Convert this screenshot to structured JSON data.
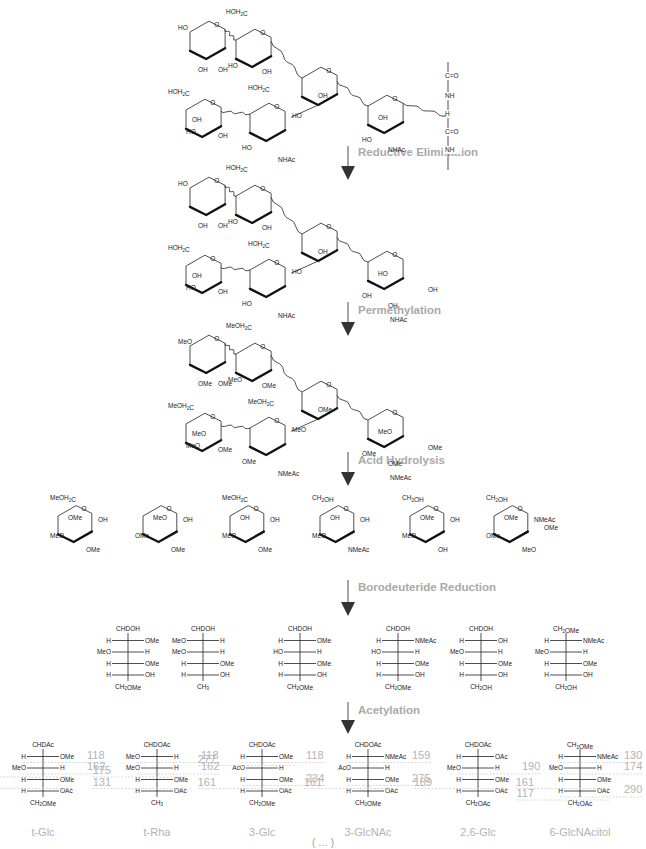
{
  "steps": [
    {
      "label": "Reductive Elimination"
    },
    {
      "label": "Permethylation"
    },
    {
      "label": "Acid Hydrolysis"
    },
    {
      "label": "Borodeuteride Reduction"
    },
    {
      "label": "Acetylation"
    }
  ],
  "glycopeptide": {
    "backbone": [
      "C=O",
      "NH",
      "H",
      "C=O",
      "NH"
    ],
    "labels": [
      "HO",
      "HOH2C",
      "OH",
      "OH",
      "HO",
      "OH",
      "HO",
      "OH",
      "HOH2C",
      "HOH2C",
      "OH",
      "HO",
      "HO",
      "OH",
      "NHAc",
      "HO",
      "OH",
      "NHAc"
    ]
  },
  "reduced": {
    "labels": [
      "HO",
      "HOH2C",
      "OH",
      "OH",
      "HO",
      "OH",
      "HO",
      "OH",
      "HOH2C",
      "HOH2C",
      "OH",
      "HO",
      "HO",
      "OH",
      "NHAc",
      "OH",
      "HO",
      "OH",
      "OH",
      "NHAc"
    ]
  },
  "permethylated": {
    "labels": [
      "MeO",
      "MeOH2C",
      "OMe",
      "OMe",
      "MeO",
      "OMe",
      "MeO",
      "OMe",
      "MeOH2C",
      "MeOH2C",
      "OMe",
      "MeO",
      "OMe",
      "MeO",
      "NMeAc",
      "OMe",
      "MeO",
      "OMe",
      "OMe",
      "NMeAc"
    ]
  },
  "hydrolysis_products": [
    {
      "top": "MeOH2C",
      "labels": [
        "OMe",
        "MeO",
        "OMe",
        "OH"
      ]
    },
    {
      "top": "",
      "labels": [
        "MeO",
        "OMe",
        "OMe",
        "OH"
      ]
    },
    {
      "top": "MeOH2C",
      "labels": [
        "OH",
        "MeO",
        "OMe",
        "OH"
      ]
    },
    {
      "top": "CH2OH",
      "labels": [
        "OH",
        "MeO",
        "NMeAc",
        "OH"
      ]
    },
    {
      "top": "CH2OH",
      "labels": [
        "OMe",
        "MeO",
        "OH",
        "OH"
      ]
    },
    {
      "top": "CH2OH",
      "labels": [
        "OMe",
        "OMe",
        "MeO",
        "NMeAc",
        "OMe"
      ]
    }
  ],
  "alditols": [
    {
      "top": "CHDOH",
      "rows": [
        [
          "H",
          "OMe"
        ],
        [
          "MeO",
          "H"
        ],
        [
          "H",
          "OMe"
        ],
        [
          "H",
          "OH"
        ]
      ],
      "bottom": "CH2OMe"
    },
    {
      "top": "CHDOH",
      "rows": [
        [
          "MeO",
          "H"
        ],
        [
          "MeO",
          "H"
        ],
        [
          "H",
          "OMe"
        ],
        [
          "H",
          "OH"
        ]
      ],
      "bottom": "CH3"
    },
    {
      "top": "CHDOH",
      "rows": [
        [
          "H",
          "OMe"
        ],
        [
          "HO",
          "H"
        ],
        [
          "H",
          "OMe"
        ],
        [
          "H",
          "OH"
        ]
      ],
      "bottom": "CH2OMe"
    },
    {
      "top": "CHDOH",
      "rows": [
        [
          "H",
          "NMeAc"
        ],
        [
          "HO",
          "H"
        ],
        [
          "H",
          "OMe"
        ],
        [
          "H",
          "OH"
        ]
      ],
      "bottom": "CH2OMe"
    },
    {
      "top": "CHDOH",
      "rows": [
        [
          "H",
          "OH"
        ],
        [
          "MeO",
          "H"
        ],
        [
          "H",
          "OMe"
        ],
        [
          "H",
          "OH"
        ]
      ],
      "bottom": "CH2OH"
    },
    {
      "top": "CH2OMe",
      "rows": [
        [
          "H",
          "NMeAc"
        ],
        [
          "MeO",
          "H"
        ],
        [
          "H",
          "OMe"
        ],
        [
          "H",
          "OH"
        ]
      ],
      "bottom": "CH2OH"
    }
  ],
  "acetates": [
    {
      "name": "t-Glc",
      "top": "CHDAc",
      "rows": [
        [
          "H",
          "OMe"
        ],
        [
          "MeO",
          "H"
        ],
        [
          "H",
          "OMe"
        ],
        [
          "H",
          "OAc"
        ]
      ],
      "bottom": "CH2OMe",
      "frags_left": [
        {
          "row": 1,
          "v": "205"
        },
        {
          "row": 2,
          "v": "161"
        }
      ],
      "frags_right": [
        {
          "row": 0,
          "v": "118"
        },
        {
          "row": 1,
          "v": "162"
        }
      ]
    },
    {
      "name": "t-Rha",
      "top": "CHDOAc",
      "rows": [
        [
          "MeO",
          "H"
        ],
        [
          "MeO",
          "H"
        ],
        [
          "H",
          "OMe"
        ],
        [
          "H",
          "OAc"
        ]
      ],
      "bottom": "CH3",
      "frags_left": [
        {
          "row": 1,
          "v": "175"
        },
        {
          "row": 2,
          "v": "131"
        }
      ],
      "frags_right": [
        {
          "row": 0,
          "v": "118"
        },
        {
          "row": 1,
          "v": "162"
        }
      ]
    },
    {
      "name": "3-Glc",
      "top": "CHDOAc",
      "rows": [
        [
          "H",
          "OMe"
        ],
        [
          "AcO",
          "H"
        ],
        [
          "H",
          "OMe"
        ],
        [
          "H",
          "OAc"
        ]
      ],
      "bottom": "CH2OMe",
      "frags_left": [
        {
          "row": 0,
          "v": "277"
        },
        {
          "row": 2,
          "v": "161"
        }
      ],
      "frags_right": [
        {
          "row": 0,
          "v": "118"
        },
        {
          "row": 2,
          "v": "234"
        }
      ]
    },
    {
      "name": "3-GlcNAc",
      "top": "CHDOAc",
      "rows": [
        [
          "H",
          "NMeAc"
        ],
        [
          "AcO",
          "H"
        ],
        [
          "H",
          "OMe"
        ],
        [
          "H",
          "OAc"
        ]
      ],
      "bottom": "CH2OMe",
      "frags_left": [
        {
          "row": 2,
          "v": "161"
        }
      ],
      "frags_right": [
        {
          "row": 0,
          "v": "159"
        },
        {
          "row": 2,
          "v": "275"
        }
      ]
    },
    {
      "name": "2,6-Glc",
      "top": "CHDOAc",
      "rows": [
        [
          "H",
          "OAc"
        ],
        [
          "MeO",
          "H"
        ],
        [
          "H",
          "OMe"
        ],
        [
          "H",
          "OAc"
        ]
      ],
      "bottom": "CH2OAc",
      "frags_left": [
        {
          "row": 2,
          "v": "189"
        }
      ],
      "frags_right": [
        {
          "row": 1,
          "v": "190"
        }
      ]
    },
    {
      "name": "6-GlcNAcitol",
      "top": "CH2OMe",
      "rows": [
        [
          "H",
          "NMeAc"
        ],
        [
          "MeO",
          "H"
        ],
        [
          "H",
          "OMe"
        ],
        [
          "H",
          "OAc"
        ]
      ],
      "bottom": "CH2OAc",
      "frags_left": [
        {
          "row": 2,
          "v": "161"
        },
        {
          "row": 3,
          "v": "117"
        }
      ],
      "frags_right": [
        {
          "row": 0,
          "v": "130"
        },
        {
          "row": 1,
          "v": "174"
        },
        {
          "row": 3,
          "v": "290"
        }
      ]
    }
  ],
  "caption": "( … )"
}
